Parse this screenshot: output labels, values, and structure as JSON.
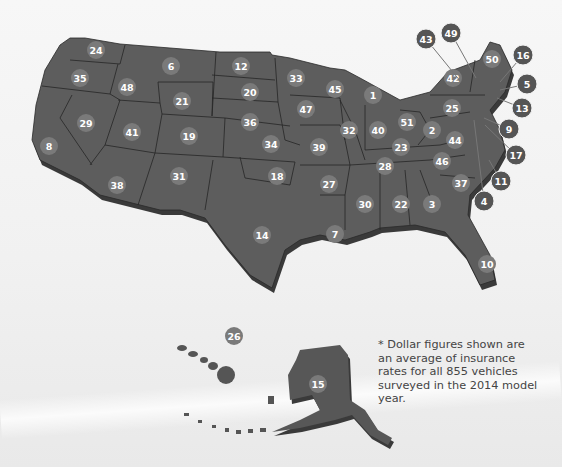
{
  "footnote": "* Dollar figures shown are an average of insurance rates for all 855 vehicles surveyed in the 2014 model year.",
  "colors": {
    "state_fill": "#5d5d5d",
    "badge": "#7a7a7a",
    "callout": "#555555",
    "background": "#f2f2f2"
  },
  "badges": [
    {
      "label": "24",
      "x": 96,
      "y": 50
    },
    {
      "label": "6",
      "x": 171,
      "y": 66
    },
    {
      "label": "12",
      "x": 241,
      "y": 66
    },
    {
      "label": "33",
      "x": 296,
      "y": 78
    },
    {
      "label": "35",
      "x": 80,
      "y": 78
    },
    {
      "label": "48",
      "x": 127,
      "y": 87
    },
    {
      "label": "20",
      "x": 250,
      "y": 92
    },
    {
      "label": "45",
      "x": 335,
      "y": 89
    },
    {
      "label": "1",
      "x": 373,
      "y": 95
    },
    {
      "label": "21",
      "x": 182,
      "y": 101
    },
    {
      "label": "47",
      "x": 306,
      "y": 109
    },
    {
      "label": "29",
      "x": 86,
      "y": 123
    },
    {
      "label": "41",
      "x": 132,
      "y": 132
    },
    {
      "label": "36",
      "x": 250,
      "y": 122
    },
    {
      "label": "32",
      "x": 349,
      "y": 130
    },
    {
      "label": "40",
      "x": 378,
      "y": 130
    },
    {
      "label": "51",
      "x": 407,
      "y": 122
    },
    {
      "label": "19",
      "x": 189,
      "y": 136
    },
    {
      "label": "34",
      "x": 271,
      "y": 144
    },
    {
      "label": "39",
      "x": 319,
      "y": 147
    },
    {
      "label": "23",
      "x": 401,
      "y": 147
    },
    {
      "label": "2",
      "x": 432,
      "y": 130
    },
    {
      "label": "44",
      "x": 455,
      "y": 140
    },
    {
      "label": "8",
      "x": 49,
      "y": 146
    },
    {
      "label": "18",
      "x": 277,
      "y": 176
    },
    {
      "label": "28",
      "x": 385,
      "y": 166
    },
    {
      "label": "46",
      "x": 442,
      "y": 161
    },
    {
      "label": "38",
      "x": 117,
      "y": 185
    },
    {
      "label": "31",
      "x": 179,
      "y": 176
    },
    {
      "label": "27",
      "x": 329,
      "y": 184
    },
    {
      "label": "37",
      "x": 461,
      "y": 183
    },
    {
      "label": "30",
      "x": 365,
      "y": 204
    },
    {
      "label": "22",
      "x": 401,
      "y": 204
    },
    {
      "label": "3",
      "x": 432,
      "y": 204
    },
    {
      "label": "14",
      "x": 262,
      "y": 235
    },
    {
      "label": "7",
      "x": 335,
      "y": 234
    },
    {
      "label": "10",
      "x": 487,
      "y": 264
    },
    {
      "label": "42",
      "x": 453,
      "y": 78
    },
    {
      "label": "25",
      "x": 452,
      "y": 108
    },
    {
      "label": "50",
      "x": 492,
      "y": 59
    },
    {
      "label": "26",
      "x": 234,
      "y": 336
    },
    {
      "label": "15",
      "x": 318,
      "y": 384
    }
  ],
  "callouts": [
    {
      "label": "43",
      "x": 426,
      "y": 39,
      "tx": 461,
      "ty": 82
    },
    {
      "label": "49",
      "x": 451,
      "y": 33,
      "tx": 476,
      "ty": 78
    },
    {
      "label": "16",
      "x": 523,
      "y": 55,
      "tx": 500,
      "ty": 82
    },
    {
      "label": "5",
      "x": 527,
      "y": 84,
      "tx": 500,
      "ty": 90
    },
    {
      "label": "13",
      "x": 522,
      "y": 108,
      "tx": 497,
      "ty": 98
    },
    {
      "label": "9",
      "x": 509,
      "y": 129,
      "tx": 484,
      "ty": 118
    },
    {
      "label": "17",
      "x": 516,
      "y": 155,
      "tx": 485,
      "ty": 125
    },
    {
      "label": "11",
      "x": 501,
      "y": 181,
      "tx": 489,
      "ty": 160
    },
    {
      "label": "4",
      "x": 484,
      "y": 201,
      "tx": 474,
      "ty": 120
    }
  ]
}
